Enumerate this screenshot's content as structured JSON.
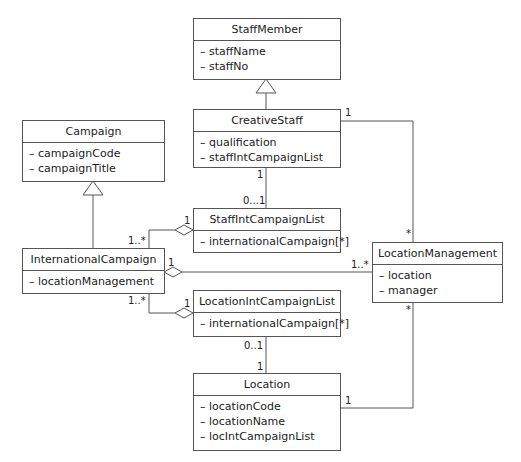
{
  "diagram": {
    "type": "UML class diagram",
    "classes": {
      "staff_member": {
        "name": "StaffMember",
        "attributes": [
          "staffName",
          "staffNo"
        ]
      },
      "creative_staff": {
        "name": "CreativeStaff",
        "attributes": [
          "qualification",
          "staffIntCampaignList"
        ]
      },
      "campaign": {
        "name": "Campaign",
        "attributes": [
          "campaignCode",
          "campaignTitle"
        ]
      },
      "staff_int_campaign_list": {
        "name": "StaffIntCampaignList",
        "attributes": [
          "internationalCampaign[*]"
        ]
      },
      "international_campaign": {
        "name": "InternationalCampaign",
        "attributes": [
          "locationManagement"
        ]
      },
      "location_management": {
        "name": "LocationManagement",
        "attributes": [
          "location",
          "manager"
        ]
      },
      "location_int_campaign_list": {
        "name": "LocationIntCampaignList",
        "attributes": [
          "internationalCampaign[*]"
        ]
      },
      "location": {
        "name": "Location",
        "attributes": [
          "locationCode",
          "locationName",
          "locIntCampaignList"
        ]
      }
    },
    "multiplicities": {
      "creative_to_locmgmt_src": "1",
      "creative_to_locmgmt_dst": "*",
      "creative_to_staffintlist_src": "1",
      "creative_to_staffintlist_dst": "0...1",
      "staffintlist_agg_whole": "1",
      "staffintlist_agg_part": "1..*",
      "intcampaign_locmgmt_whole": "1",
      "intcampaign_locmgmt_part": "1..*",
      "locintlist_agg_whole": "1",
      "locintlist_agg_part": "1..*",
      "locintlist_to_location_src": "0..1",
      "locintlist_to_location_dst": "1",
      "location_to_locmgmt_src": "1",
      "location_to_locmgmt_dst": "*"
    },
    "relationships": [
      {
        "kind": "generalization",
        "from": "CreativeStaff",
        "to": "StaffMember"
      },
      {
        "kind": "generalization",
        "from": "InternationalCampaign",
        "to": "Campaign"
      },
      {
        "kind": "association",
        "from": "CreativeStaff",
        "to": "LocationManagement"
      },
      {
        "kind": "association",
        "from": "CreativeStaff",
        "to": "StaffIntCampaignList"
      },
      {
        "kind": "aggregation",
        "whole": "StaffIntCampaignList",
        "part": "InternationalCampaign"
      },
      {
        "kind": "aggregation",
        "whole": "InternationalCampaign",
        "part": "LocationManagement"
      },
      {
        "kind": "aggregation",
        "whole": "LocationIntCampaignList",
        "part": "InternationalCampaign"
      },
      {
        "kind": "association",
        "from": "LocationIntCampaignList",
        "to": "Location"
      },
      {
        "kind": "association",
        "from": "Location",
        "to": "LocationManagement"
      }
    ],
    "colors": {
      "line": "#555555",
      "text": "#222222",
      "background": "#ffffff"
    }
  }
}
